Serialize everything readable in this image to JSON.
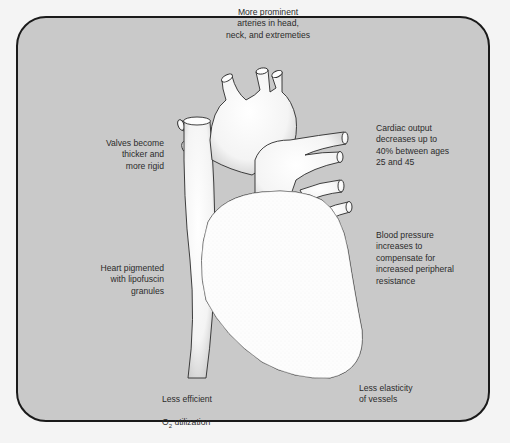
{
  "figure": {
    "type": "annotated anatomical diagram",
    "background_color": "#c9c9c9",
    "border_color": "#1a1a1a",
    "heart_fill": "#fbfbfb"
  },
  "labels": {
    "top": "More prominent\narteries in head,\nneck, and extremeties",
    "upper_left": "Valves become\nthicker and\nmore rigid",
    "upper_right": "Cardiac output\ndecreases up to\n40% between ages\n25 and 45",
    "middle_left": "Heart pigmented\nwith lipofuscin\ngranules",
    "middle_right": "Blood pressure\nincreases to\ncompensate for\nincreased peripheral\nresistance",
    "bottom_left_line1": "Less efficient",
    "bottom_left_line2_prefix": "O",
    "bottom_left_line2_sub": "2",
    "bottom_left_line2_suffix": " utilization",
    "bottom_right": "Less elasticity\nof vessels"
  }
}
